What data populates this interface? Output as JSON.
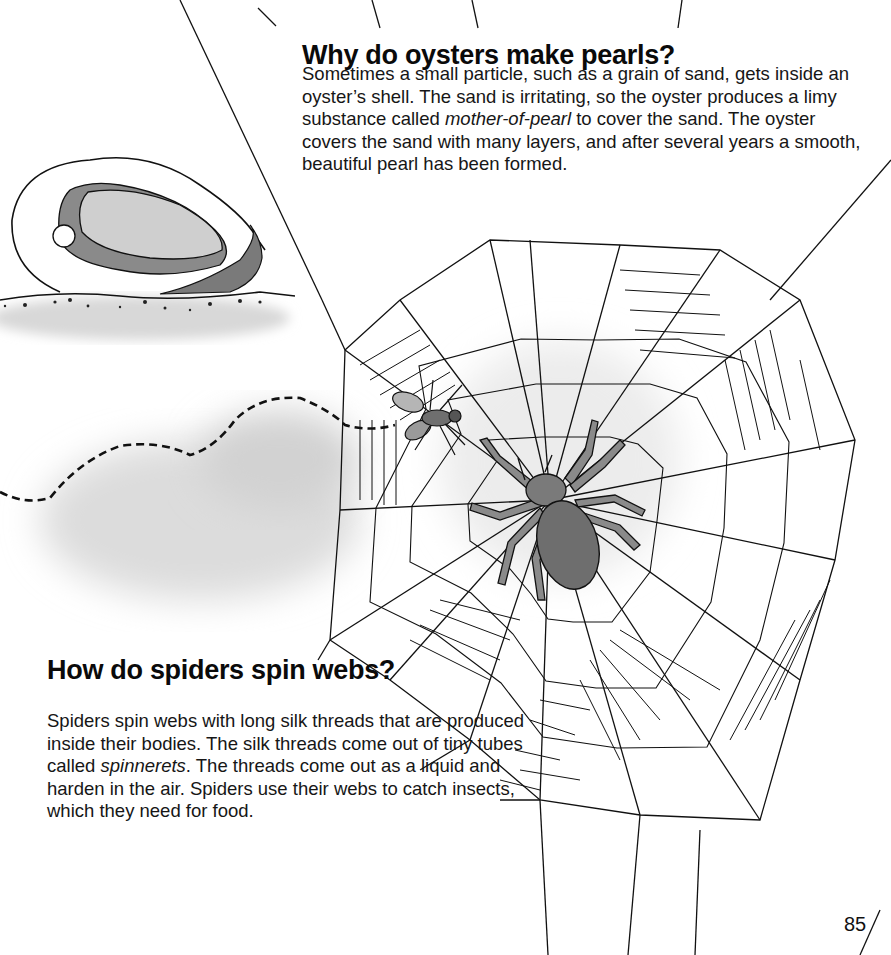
{
  "sections": [
    {
      "title": "Why do oysters make pearls?",
      "body_parts": [
        "Sometimes a small particle, such as a grain of sand, gets inside an oyster’s shell. The sand is irritating, so the oyster produces a limy substance called ",
        "mother-of-pearl",
        " to cover the sand. The oyster covers the sand with many layers, and after several years a smooth, beautiful pearl has been formed."
      ]
    },
    {
      "title": "How do spiders spin webs?",
      "body_parts": [
        "Spiders spin webs with long silk threads that are produced inside their bodies. The silk threads come out of tiny tubes called ",
        "spinnerets",
        ". The threads come out as a liquid and harden in the air. Spiders use their webs to catch insects, which they need for food."
      ]
    }
  ],
  "illustrations": {
    "oyster": "oyster-with-pearl-illustration",
    "web": "spider-web-illustration",
    "spider": "spider-illustration",
    "fly": "fly-illustration",
    "flight_path": "dashed-flight-path"
  },
  "colors": {
    "ink": "#111111",
    "shell_gray": "#8a8a8a",
    "shell_light": "#cfcfcf",
    "shadow": "#d4d4d4",
    "spider_body": "#6e6e6e"
  },
  "page_number": "85"
}
